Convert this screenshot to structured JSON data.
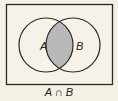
{
  "diagram": {
    "type": "venn",
    "sets": [
      {
        "label": "A"
      },
      {
        "label": "B"
      }
    ],
    "shaded_region": "intersection",
    "caption": "A ∩ B",
    "colors": {
      "background": "#f4f0e4",
      "shade": "#b9b9b9",
      "stroke": "#2a2a2a"
    }
  }
}
